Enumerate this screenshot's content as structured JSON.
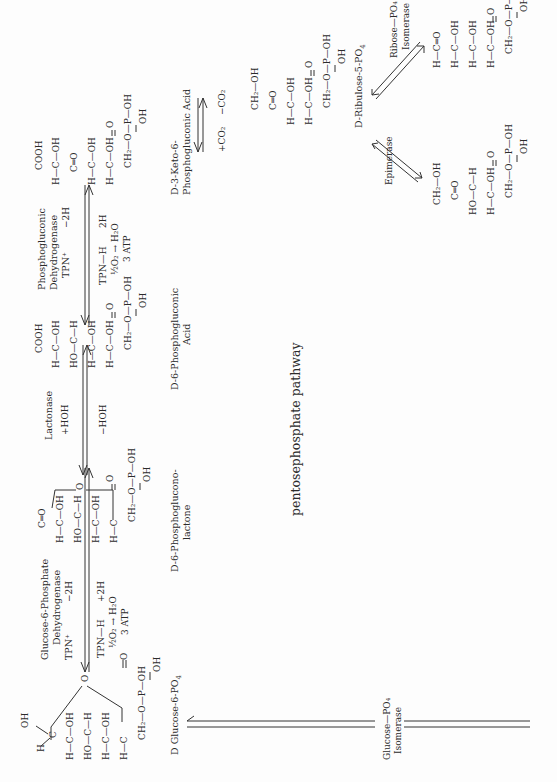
{
  "title": "pentosephosphate pathway",
  "orientation": "rotated 90° counter-clockwise (text reads bottom-to-top)",
  "compounds": {
    "glucose6p": {
      "name": "D Glucose-6-PO",
      "name_sub": "4",
      "rows": [
        "H",
        "C",
        "OH",
        "H—C—OH",
        "HO—C—H",
        "H—C—OH",
        "H—C",
        "CH₂—O—P—OH",
        "O",
        "OH"
      ],
      "ring_o": "O"
    },
    "lactone": {
      "name_line1": "D-6-Phosphoglucono-",
      "name_line2": "lactone",
      "rows": [
        "C═O",
        "H—C—OH",
        "HO—C—H",
        "H—C—OH",
        "H—C",
        "CH₂—O—P—OH"
      ],
      "ring_o": "O"
    },
    "gluconic": {
      "name_line1": "D-6-Phosphogluconic",
      "name_line2": "Acid",
      "rows": [
        "COOH",
        "H—C—OH",
        "HO—C—H",
        "H—C—OH",
        "H—C—OH",
        "CH₂—O—P—OH"
      ]
    },
    "keto": {
      "name_line1": "D-3-Keto-6-",
      "name_line2": "Phosphogluconic Acid",
      "rows": [
        "COOH",
        "H—C—OH",
        "C═O",
        "H—C—OH",
        "H—C—OH",
        "CH₂—O—P—OH"
      ]
    },
    "ribulose": {
      "name": "D-Ribulose-5-PO",
      "name_sub": "4",
      "rows": [
        "CH₂—OH",
        "C═O",
        "H—C—OH",
        "H—C—OH",
        "CH₂—O—P—OH"
      ]
    },
    "ribose": {
      "rows": [
        "H—C═O",
        "H—C—OH",
        "H—C—OH",
        "H—C—OH",
        "CH₂—O—P—OH"
      ]
    },
    "xylulose": {
      "rows": [
        "CH₂—OH",
        "C═O",
        "HO—C—H",
        "H—C—OH",
        "CH₂—O—P—OH"
      ]
    }
  },
  "reactions": {
    "g6pdh": {
      "enzyme_line1": "Glucose-6-Phosphate",
      "enzyme_line2": "Dehydrogenase",
      "cofactor": "TPN⁺",
      "minus2h": "−2H",
      "tpnh": "TPN—H",
      "plus2h": "+2H",
      "oxid": "½O₂ → H₂O",
      "atp": "3 ATP"
    },
    "lactonase": {
      "enzyme": "Lactonase",
      "plus_hoh": "+HOH",
      "minus_hoh": "−HOH"
    },
    "pgdh": {
      "enzyme_line1": "Phosphogluconic",
      "enzyme_line2": "Dehydrogenase",
      "cofactor": "TPN⁺",
      "minus2h": "−2H",
      "tpnh": "TPN—H",
      "twoh": "2H",
      "oxid": "½O₂ → H₂O",
      "atp": "3 ATP"
    },
    "decarb": {
      "minus_co2": "−CO₂",
      "plus_co2": "+CO₂"
    },
    "ribose_isomerase": {
      "line1": "Ribose—PO₄",
      "line2": "Isomerase"
    },
    "epimerase": {
      "label": "Epimerase"
    },
    "glucose_isomerase": {
      "line1": "Glucose—PO₄",
      "line2": "Isomerase"
    }
  },
  "colors": {
    "ink": "#2b2b2b",
    "paper": "#fdfdfd"
  }
}
